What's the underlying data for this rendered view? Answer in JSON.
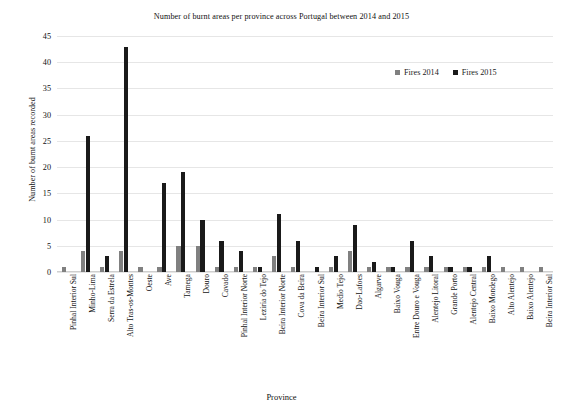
{
  "chart_data": {
    "type": "bar",
    "title": "Number of burnt areas per province across Portugal between 2014 and 2015",
    "xlabel": "Province",
    "ylabel": "Number of burnt areas recorded",
    "ylim": [
      0,
      45
    ],
    "yticks": [
      0,
      5,
      10,
      15,
      20,
      25,
      30,
      35,
      40,
      45
    ],
    "grid": true,
    "legend_position": "top-right",
    "categories": [
      "Pinhal Interior Sul",
      "Minho-Lima",
      "Serra da Estrela",
      "Alto Tras-os-Montes",
      "Oeste",
      "Ave",
      "Tamega",
      "Douro",
      "Cavado",
      "Pinhal Interior Norte",
      "Leziria do Tejo",
      "Beira Interior Norte",
      "Cova da Beira",
      "Beira Interior Sul",
      "Medio Tejo",
      "Dao-Lafoes",
      "Algarve",
      "Baixo Vouga",
      "Entre Douro e Vouga",
      "Alentejo Litoral",
      "Grande Porto",
      "Alentejo Central",
      "Baixo Mondego",
      "Alto Alentejo",
      "Baixo Alentejo",
      "Beira Interior Sul"
    ],
    "series": [
      {
        "name": "Fires 2014",
        "color": "#808080",
        "values": [
          1,
          4,
          1,
          4,
          1,
          1,
          5,
          5,
          1,
          1,
          1,
          3,
          1,
          0,
          1,
          4,
          1,
          1,
          1,
          1,
          1,
          1,
          1,
          1,
          1,
          1
        ]
      },
      {
        "name": "Fires 2015",
        "color": "#1a1a1a",
        "values": [
          0,
          26,
          3,
          43,
          0,
          17,
          19,
          10,
          6,
          4,
          1,
          11,
          6,
          1,
          3,
          9,
          2,
          1,
          6,
          3,
          1,
          1,
          3,
          0,
          0,
          0
        ]
      }
    ]
  },
  "legend": {
    "items": [
      {
        "label": "Fires 2014",
        "color": "#808080"
      },
      {
        "label": "Fires 2015",
        "color": "#1a1a1a"
      }
    ]
  }
}
